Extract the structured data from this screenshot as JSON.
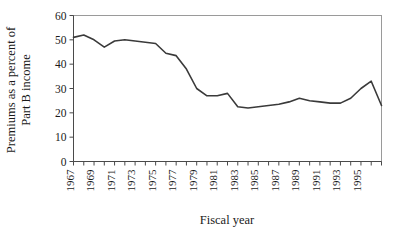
{
  "chart_data": {
    "type": "line",
    "title": "",
    "xlabel": "Fiscal year",
    "ylabel_line1": "Premiums as a percent of",
    "ylabel_line2": "Part B income",
    "ylabel": "Premiums as a percent of Part B income",
    "xlim": [
      1967,
      1997
    ],
    "ylim": [
      0,
      60
    ],
    "yticks": [
      0,
      10,
      20,
      30,
      40,
      50,
      60
    ],
    "ytick_labels": [
      "0",
      "10",
      "20",
      "30",
      "40",
      "50",
      "60"
    ],
    "xticks": [
      1967,
      1968,
      1969,
      1970,
      1971,
      1972,
      1973,
      1974,
      1975,
      1976,
      1977,
      1978,
      1979,
      1980,
      1981,
      1982,
      1983,
      1984,
      1985,
      1986,
      1987,
      1988,
      1989,
      1990,
      1991,
      1992,
      1993,
      1994,
      1995,
      1996,
      1997
    ],
    "xtick_labels": [
      "1967",
      "1969",
      "1971",
      "1973",
      "1975",
      "1977",
      "1979",
      "1981",
      "1983",
      "1985",
      "1987",
      "1989",
      "1991",
      "1993",
      "1995"
    ],
    "xtick_label_years": [
      1967,
      1969,
      1971,
      1973,
      1975,
      1977,
      1979,
      1981,
      1983,
      1985,
      1987,
      1989,
      1991,
      1993,
      1995
    ],
    "grid": false,
    "legend": "none",
    "line_color": "#3a3a3a",
    "x": [
      1967,
      1968,
      1969,
      1970,
      1971,
      1972,
      1973,
      1974,
      1975,
      1976,
      1977,
      1978,
      1979,
      1980,
      1981,
      1982,
      1983,
      1984,
      1985,
      1986,
      1987,
      1988,
      1989,
      1990,
      1991,
      1992,
      1993,
      1994,
      1995,
      1996,
      1997
    ],
    "values": [
      51,
      52,
      50,
      47,
      49.5,
      50,
      49.5,
      49,
      48.5,
      44.5,
      43.5,
      38,
      30,
      27,
      27,
      28,
      22.5,
      22,
      22.5,
      23,
      23.5,
      24.5,
      26,
      25,
      24.5,
      24,
      24,
      26,
      30,
      33,
      23
    ],
    "series": [
      {
        "name": "Premiums as a percent of Part B income",
        "values": [
          51,
          52,
          50,
          47,
          49.5,
          50,
          49.5,
          49,
          48.5,
          44.5,
          43.5,
          38,
          30,
          27,
          27,
          28,
          22.5,
          22,
          22.5,
          23,
          23.5,
          24.5,
          26,
          25,
          24.5,
          24,
          24,
          26,
          30,
          33,
          23
        ]
      }
    ]
  }
}
